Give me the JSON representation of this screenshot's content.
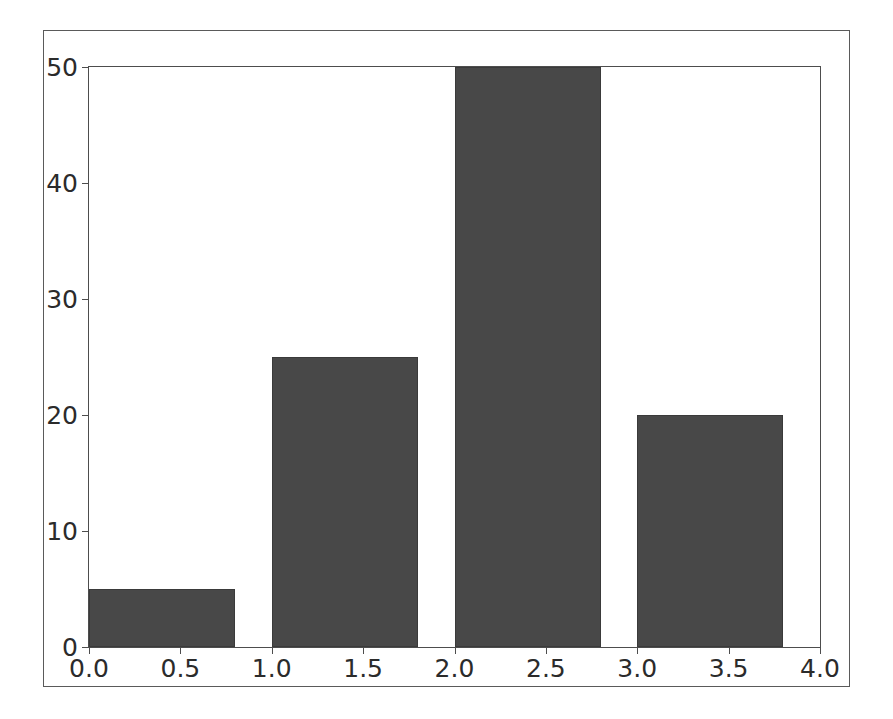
{
  "chart_data": {
    "type": "bar",
    "title": "",
    "subtitle": "",
    "xlabel": "",
    "ylabel": "",
    "xlim": [
      0.0,
      4.0
    ],
    "ylim": [
      0,
      50
    ],
    "grid": false,
    "legend": null,
    "bar_width": 0.8,
    "bar_color": "#484848",
    "edge_color": "#3a3a3a",
    "background_color": "#ffffff",
    "axes_color": "#4d4d4d",
    "categories": [
      "0",
      "1",
      "2",
      "3"
    ],
    "x": [
      0,
      1,
      2,
      3
    ],
    "values": [
      5,
      25,
      50,
      20
    ],
    "bars": [
      {
        "label": "0",
        "x_left": 0.0,
        "x_right": 0.8,
        "value": 5
      },
      {
        "label": "1",
        "x_left": 1.0,
        "x_right": 1.8,
        "value": 25
      },
      {
        "label": "2",
        "x_left": 2.0,
        "x_right": 2.8,
        "value": 50
      },
      {
        "label": "3",
        "x_left": 3.0,
        "x_right": 3.8,
        "value": 20
      }
    ],
    "xticks": [
      {
        "value": 0.0,
        "label": "0.0"
      },
      {
        "value": 0.5,
        "label": "0.5"
      },
      {
        "value": 1.0,
        "label": "1.0"
      },
      {
        "value": 1.5,
        "label": "1.5"
      },
      {
        "value": 2.0,
        "label": "2.0"
      },
      {
        "value": 2.5,
        "label": "2.5"
      },
      {
        "value": 3.0,
        "label": "3.0"
      },
      {
        "value": 3.5,
        "label": "3.5"
      },
      {
        "value": 4.0,
        "label": "4.0"
      }
    ],
    "yticks": [
      {
        "value": 0,
        "label": "0"
      },
      {
        "value": 10,
        "label": "10"
      },
      {
        "value": 20,
        "label": "20"
      },
      {
        "value": 30,
        "label": "30"
      },
      {
        "value": 40,
        "label": "40"
      },
      {
        "value": 50,
        "label": "50"
      }
    ]
  }
}
